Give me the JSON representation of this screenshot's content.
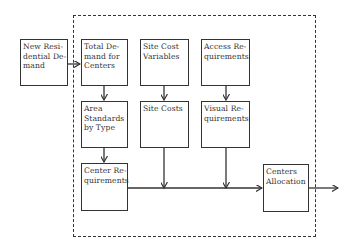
{
  "diagram": {
    "boundary": "dashed-system-boundary",
    "boxes": [
      {
        "id": "new_residential_demand",
        "label": "New Resi-\ndential De-\nmand"
      },
      {
        "id": "total_demand",
        "label": "Total De-\nmand for\nCenters"
      },
      {
        "id": "site_cost_variables",
        "label": "Site Cost\nVariables"
      },
      {
        "id": "access_requirements",
        "label": "Access Re-\nquirements"
      },
      {
        "id": "area_standards",
        "label": "Area\nStandards\nby Type"
      },
      {
        "id": "site_costs",
        "label": "Site Costs"
      },
      {
        "id": "visual_requirements",
        "label": "Visual Re-\nquirements"
      },
      {
        "id": "center_requirements",
        "label": "Center Re-\nquirements"
      },
      {
        "id": "centers_allocation",
        "label": "Centers\nAllocation"
      }
    ],
    "edges": [
      {
        "from": "new_residential_demand",
        "to": "total_demand"
      },
      {
        "from": "total_demand",
        "to": "area_standards"
      },
      {
        "from": "site_cost_variables",
        "to": "site_costs"
      },
      {
        "from": "access_requirements",
        "to": "visual_requirements"
      },
      {
        "from": "area_standards",
        "to": "center_requirements"
      },
      {
        "from": "center_requirements",
        "to": "centers_allocation"
      },
      {
        "from": "site_costs",
        "to": "centers_allocation"
      },
      {
        "from": "visual_requirements",
        "to": "centers_allocation"
      },
      {
        "from": "centers_allocation",
        "to": "output"
      }
    ]
  }
}
